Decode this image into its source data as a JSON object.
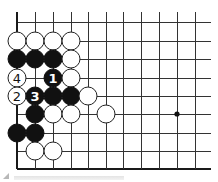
{
  "diagram": {
    "type": "go-board-fragment",
    "grid": {
      "x_lines": [
        17,
        35,
        53,
        71,
        88,
        106,
        123,
        141,
        159,
        177,
        195
      ],
      "y_lines": [
        22,
        41,
        59,
        78,
        96,
        114,
        133,
        151,
        169
      ],
      "x_extent_right": 211,
      "y_extent_top": 12,
      "left_edge": true,
      "bottom_edge": true
    },
    "star_points": [
      {
        "col": 9,
        "row": 5
      }
    ],
    "stone_radius": 9,
    "stones": [
      {
        "col": 0,
        "row": 1,
        "color": "white"
      },
      {
        "col": 1,
        "row": 1,
        "color": "white"
      },
      {
        "col": 2,
        "row": 1,
        "color": "white"
      },
      {
        "col": 3,
        "row": 1,
        "color": "white"
      },
      {
        "col": 0,
        "row": 2,
        "color": "black"
      },
      {
        "col": 1,
        "row": 2,
        "color": "black"
      },
      {
        "col": 2,
        "row": 2,
        "color": "black"
      },
      {
        "col": 3,
        "row": 2,
        "color": "white"
      },
      {
        "col": 0,
        "row": 3,
        "color": "white",
        "label": "4"
      },
      {
        "col": 2,
        "row": 3,
        "color": "black",
        "label": "1"
      },
      {
        "col": 3,
        "row": 3,
        "color": "white"
      },
      {
        "col": 0,
        "row": 4,
        "color": "white",
        "label": "2"
      },
      {
        "col": 1,
        "row": 4,
        "color": "black",
        "label": "3"
      },
      {
        "col": 2,
        "row": 4,
        "color": "black"
      },
      {
        "col": 3,
        "row": 4,
        "color": "black"
      },
      {
        "col": 4,
        "row": 4,
        "color": "white"
      },
      {
        "col": 1,
        "row": 5,
        "color": "black"
      },
      {
        "col": 2,
        "row": 5,
        "color": "white"
      },
      {
        "col": 3,
        "row": 5,
        "color": "white"
      },
      {
        "col": 5,
        "row": 5,
        "color": "white"
      },
      {
        "col": 0,
        "row": 6,
        "color": "black"
      },
      {
        "col": 1,
        "row": 6,
        "color": "black"
      },
      {
        "col": 1,
        "row": 7,
        "color": "white"
      },
      {
        "col": 2,
        "row": 7,
        "color": "white"
      }
    ],
    "move_labels": [
      "1",
      "2",
      "3",
      "4"
    ]
  }
}
